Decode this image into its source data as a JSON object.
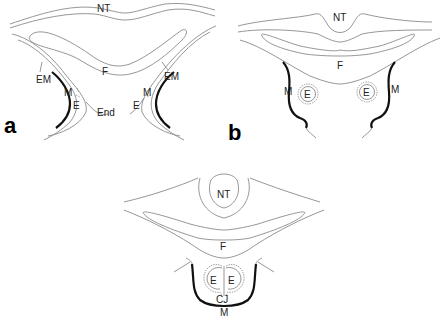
{
  "figure": {
    "panels": [
      {
        "id": "a",
        "label": "a",
        "structures": {
          "nt": "NT",
          "f": "F",
          "em_left": "EM",
          "em_right": "EM",
          "m_left": "M",
          "m_right": "M",
          "e_left": "E",
          "e_right": "E",
          "end": "End"
        }
      },
      {
        "id": "b",
        "label": "b",
        "structures": {
          "nt": "NT",
          "f": "F",
          "m_left": "M",
          "m_right": "M",
          "e_left": "E",
          "e_right": "E"
        }
      },
      {
        "id": "c",
        "label": "",
        "structures": {
          "nt": "NT",
          "f": "F",
          "e_left": "E",
          "e_right": "E",
          "cj": "CJ",
          "m": "M"
        }
      }
    ]
  }
}
